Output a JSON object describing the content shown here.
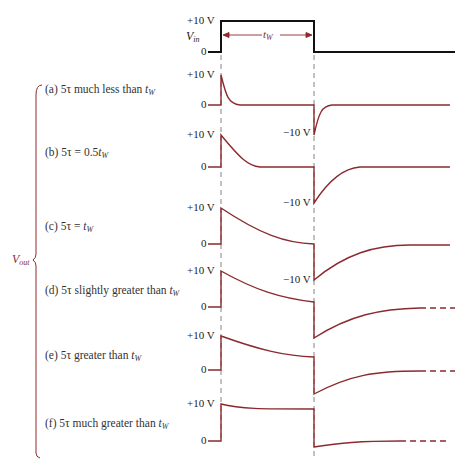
{
  "colors": {
    "waveform": "#8b2a2e",
    "input_pulse": "#111111",
    "dashes": "#555555",
    "brace": "#8b2a2e",
    "text": "#222222"
  },
  "input": {
    "label": "V",
    "label_sub": "in",
    "high_label": "+10 V",
    "zero_label": "0",
    "width_label": "t",
    "width_label_sub": "W"
  },
  "output_group": {
    "label": "V",
    "label_sub": "out"
  },
  "cases": [
    {
      "id": "a",
      "caption_prefix": "(a) 5τ much less than ",
      "caption_var": "t",
      "caption_sub": "W",
      "high_label": "+10 V",
      "zero_label": "0",
      "neg_label": "−10 V"
    },
    {
      "id": "b",
      "caption_prefix": "(b) 5τ = 0.5",
      "caption_var": "t",
      "caption_sub": "W",
      "high_label": "+10 V",
      "zero_label": "0",
      "neg_label": "−10 V"
    },
    {
      "id": "c",
      "caption_prefix": "(c) 5τ = ",
      "caption_var": "t",
      "caption_sub": "W",
      "high_label": "+10 V",
      "zero_label": "0",
      "neg_label": "−10 V"
    },
    {
      "id": "d",
      "caption_prefix": "(d) 5τ slightly greater than ",
      "caption_var": "t",
      "caption_sub": "W",
      "high_label": "+10 V",
      "zero_label": "0"
    },
    {
      "id": "e",
      "caption_prefix": "(e) 5τ greater than ",
      "caption_var": "t",
      "caption_sub": "W",
      "high_label": "+10 V",
      "zero_label": "0"
    },
    {
      "id": "f",
      "caption_prefix": "(f) 5τ much greater than ",
      "caption_var": "t",
      "caption_sub": "W",
      "high_label": "+10 V",
      "zero_label": "0"
    }
  ]
}
